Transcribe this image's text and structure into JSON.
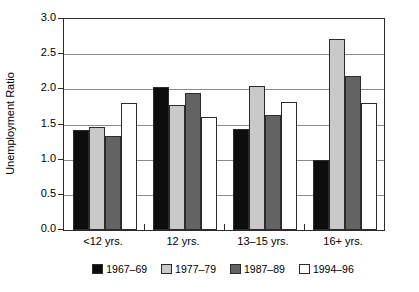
{
  "chart_data": {
    "type": "bar",
    "title": "",
    "subtitle": "",
    "xlabel": "",
    "ylabel": "Unemployment Ratio",
    "ylim": [
      0.0,
      3.0
    ],
    "ytick_labels": [
      "0.0",
      "0.5",
      "1.0",
      "1.5",
      "2.0",
      "2.5",
      "3.0"
    ],
    "ytick_values": [
      0.0,
      0.5,
      1.0,
      1.5,
      2.0,
      2.5,
      3.0
    ],
    "grid": "horizontal",
    "legend_position": "bottom",
    "categories": [
      "<12 yrs.",
      "12 yrs.",
      "13–15 yrs.",
      "16+ yrs."
    ],
    "series": [
      {
        "name": "1967–69",
        "color": "#0d0d0d",
        "values": [
          1.42,
          2.04,
          1.44,
          1.0
        ]
      },
      {
        "name": "1977–79",
        "color": "#c9c9c9",
        "values": [
          1.46,
          1.78,
          2.05,
          2.71
        ]
      },
      {
        "name": "1987–89",
        "color": "#636363",
        "values": [
          1.34,
          1.95,
          1.63,
          2.19
        ]
      },
      {
        "name": "1994–96",
        "color": "#ffffff",
        "values": [
          1.8,
          1.61,
          1.82,
          1.8
        ]
      }
    ]
  },
  "axes": {
    "y_title": "Unemployment Ratio"
  }
}
